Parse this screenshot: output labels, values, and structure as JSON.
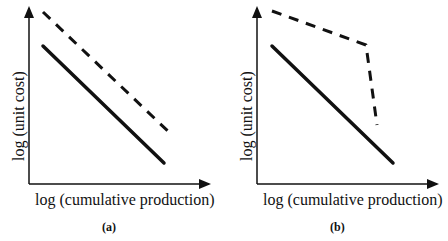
{
  "figure": {
    "panels": [
      {
        "id": "a",
        "caption": "(a)",
        "xlabel": "log (cumulative production)",
        "ylabel": "log (unit cost)",
        "lines": [
          {
            "style": "solid",
            "points": [
              [
                43,
                46
              ],
              [
                164,
                163
              ]
            ]
          },
          {
            "style": "dashed",
            "points": [
              [
                43,
                12
              ],
              [
                172,
                135
              ]
            ]
          }
        ]
      },
      {
        "id": "b",
        "caption": "(b)",
        "xlabel": "log (cumulative production)",
        "ylabel": "log (unit cost)",
        "lines": [
          {
            "style": "solid",
            "points": [
              [
                272,
                46
              ],
              [
                393,
                163
              ]
            ]
          },
          {
            "style": "dashed",
            "points": [
              [
                272,
                11
              ],
              [
                366,
                45
              ],
              [
                377,
                125
              ]
            ]
          }
        ]
      }
    ],
    "colors": {
      "ink": "#111111",
      "background": "#ffffff"
    }
  }
}
